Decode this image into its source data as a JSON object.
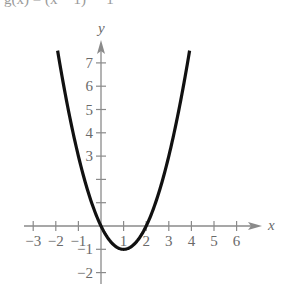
{
  "caption": "g(x) = (x − 1)² − 1",
  "colors": {
    "axis": "#8a8a8a",
    "curve": "#111111",
    "label": "#6a6a6a"
  },
  "chart_data": {
    "type": "line",
    "title": "",
    "function": "y = (x - 1)^2 - 1",
    "xlabel": "x",
    "ylabel": "y",
    "xlim": [
      -3.4,
      7.1
    ],
    "ylim": [
      -2.5,
      8.0
    ],
    "grid": false,
    "legend": null,
    "x_ticks": [
      -3,
      -2,
      -1,
      1,
      2,
      3,
      4,
      5,
      6
    ],
    "x_tick_labels": [
      "−3",
      "−2",
      "−1",
      "1",
      "2",
      "3",
      "4",
      "5",
      "6"
    ],
    "y_ticks": [
      -2,
      -1,
      1,
      2,
      3,
      4,
      5,
      6,
      7
    ],
    "y_tick_labels": [
      "−2",
      "−1",
      "",
      "",
      "3",
      "4",
      "5",
      "6",
      "7"
    ],
    "series": [
      {
        "name": "parabola",
        "x": [
          -1.9,
          -1.5,
          -1,
          -0.5,
          0,
          0.5,
          1,
          1.5,
          2,
          2.5,
          3,
          3.5,
          3.9
        ],
        "y": [
          7.41,
          5.25,
          3,
          1.25,
          0,
          -0.75,
          -1,
          -0.75,
          0,
          1.25,
          3,
          5.25,
          7.41
        ]
      }
    ],
    "annotations": {
      "vertex": [
        1,
        -1
      ],
      "x_intercepts": [
        0,
        2
      ]
    }
  }
}
